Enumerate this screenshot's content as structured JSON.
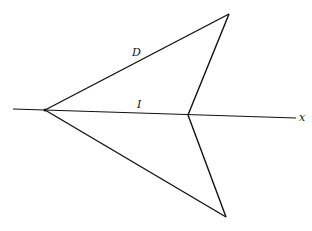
{
  "diagram": {
    "labels": {
      "D": "D",
      "I": "I",
      "x_axis": "x"
    },
    "points": {
      "left_vertex": [
        45,
        110
      ],
      "top_vertex": [
        229,
        14
      ],
      "middle_vertex": [
        188,
        115
      ],
      "bottom_vertex": [
        226,
        217
      ]
    },
    "axis": {
      "start": [
        13,
        109
      ],
      "end": [
        296,
        118
      ]
    },
    "stroke_color": "#111111"
  }
}
